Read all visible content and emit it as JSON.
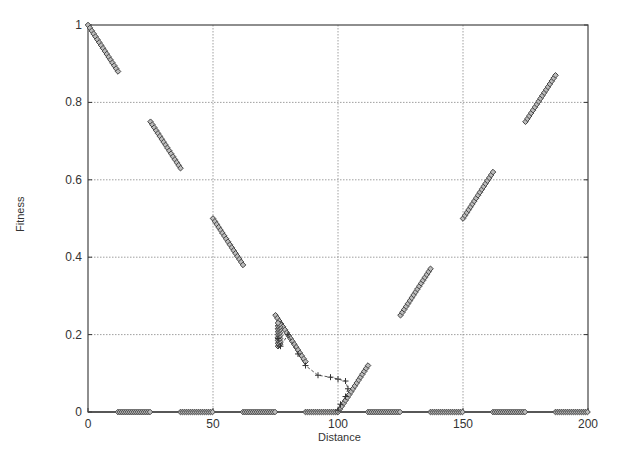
{
  "chart_data": {
    "type": "scatter",
    "title": "",
    "xlabel": "Distance",
    "ylabel": "Fitness",
    "xlim": [
      0,
      200
    ],
    "ylim": [
      0,
      1
    ],
    "xticks": [
      "0",
      "50",
      "100",
      "150",
      "200"
    ],
    "yticks": [
      "0",
      "0.2",
      "0.4",
      "0.6",
      "0.8",
      "1"
    ],
    "grid": true,
    "legend": null,
    "series": [
      {
        "name": "fitness-landscape",
        "marker": "diamond",
        "segments": [
          {
            "x": [
              0,
              12
            ],
            "y": [
              1.0,
              0.88
            ]
          },
          {
            "x": [
              25,
              37
            ],
            "y": [
              0.75,
              0.63
            ]
          },
          {
            "x": [
              50,
              62
            ],
            "y": [
              0.5,
              0.38
            ]
          },
          {
            "x": [
              75,
              87
            ],
            "y": [
              0.25,
              0.13
            ]
          },
          {
            "x": [
              100,
              112
            ],
            "y": [
              0.0,
              0.12
            ]
          },
          {
            "x": [
              125,
              137
            ],
            "y": [
              0.25,
              0.37
            ]
          },
          {
            "x": [
              150,
              162
            ],
            "y": [
              0.5,
              0.62
            ]
          },
          {
            "x": [
              175,
              187
            ],
            "y": [
              0.75,
              0.87
            ]
          }
        ],
        "zero_clusters": [
          [
            12,
            25
          ],
          [
            37,
            50
          ],
          [
            62,
            75
          ],
          [
            87,
            100
          ],
          [
            112,
            125
          ],
          [
            137,
            150
          ],
          [
            162,
            175
          ],
          [
            187,
            200
          ]
        ]
      },
      {
        "name": "search-trajectory",
        "marker": "plus",
        "points": [
          [
            76,
            0.19
          ],
          [
            77,
            0.17
          ],
          [
            80,
            0.2
          ],
          [
            84,
            0.15
          ],
          [
            87,
            0.12
          ],
          [
            92,
            0.095
          ],
          [
            97,
            0.09
          ],
          [
            100,
            0.085
          ],
          [
            103,
            0.08
          ],
          [
            104,
            0.06
          ],
          [
            103,
            0.04
          ],
          [
            101,
            0.02
          ],
          [
            100,
            0.005
          ]
        ]
      }
    ]
  }
}
